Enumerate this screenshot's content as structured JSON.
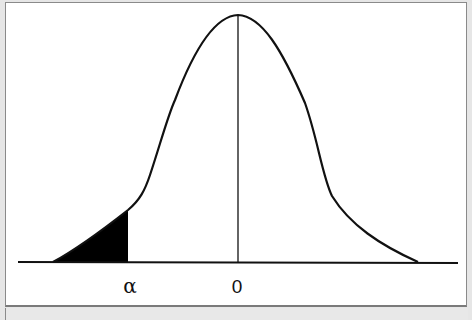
{
  "figure": {
    "type": "normal-distribution-left-tail",
    "axis_labels": {
      "alpha": "α",
      "zero": "0"
    },
    "colors": {
      "curve": "#111111",
      "shaded_region": "#000000",
      "background": "#ffffff",
      "frame_border": "#8a8a8a",
      "footer_strip": "#e8e8e8"
    }
  }
}
